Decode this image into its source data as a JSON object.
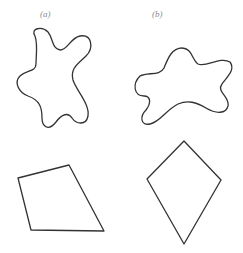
{
  "figure": {
    "panels": [
      {
        "label": "(a)",
        "blob": "irregular closed curve (a)",
        "polygon": "quadrilateral (irregular)"
      },
      {
        "label": "(b)",
        "blob": "irregular closed curve (b)",
        "polygon": "kite / rhombus"
      }
    ],
    "stroke_color": "#333333",
    "background": "#ffffff"
  }
}
